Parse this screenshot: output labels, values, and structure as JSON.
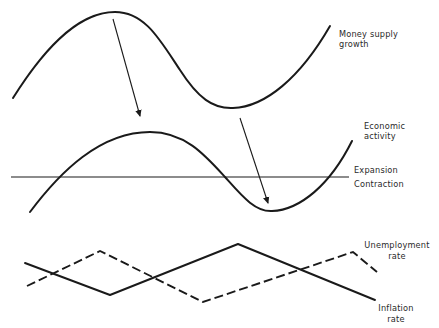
{
  "diagram": {
    "type": "economic-cycle-relationship",
    "panels": [
      {
        "id": "money-supply",
        "label_lines": [
          "Money supply",
          "growth"
        ]
      },
      {
        "id": "economic-activity",
        "label_lines": [
          "Economic",
          "activity"
        ],
        "baseline_labels": {
          "above": "Expansion",
          "below": "Contraction"
        }
      },
      {
        "id": "rates",
        "series": [
          {
            "name": "Unemployment rate",
            "style": "dashed",
            "label_lines": [
              "Unemployment",
              "rate"
            ]
          },
          {
            "name": "Inflation rate",
            "style": "solid",
            "label_lines": [
              "Inflation",
              "rate"
            ]
          }
        ]
      }
    ],
    "arrows": [
      {
        "from": "money-supply peak",
        "to": "economic-activity peak"
      },
      {
        "from": "money-supply trough",
        "to": "economic-activity trough"
      }
    ],
    "colors": {
      "line": "#1a1a1a",
      "text": "#2a2a2a",
      "background": "#ffffff"
    }
  }
}
